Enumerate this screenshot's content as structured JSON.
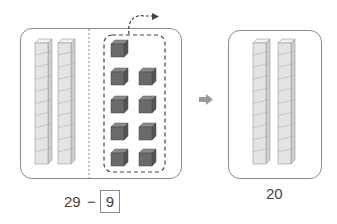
{
  "left_group": {
    "tens_rods": 2,
    "unit_cubes": 9,
    "equation": {
      "minuend": "29",
      "operator": "−",
      "answer_box": "9"
    }
  },
  "arrow": "right-arrow",
  "right_group": {
    "tens_rods": 2,
    "result": "20"
  },
  "colors": {
    "panel_border": "#8c8c8c",
    "rod_fill": "#e4e4e4",
    "cube_fill": "#6a6a6a",
    "arrow": "#9a9a9a"
  }
}
